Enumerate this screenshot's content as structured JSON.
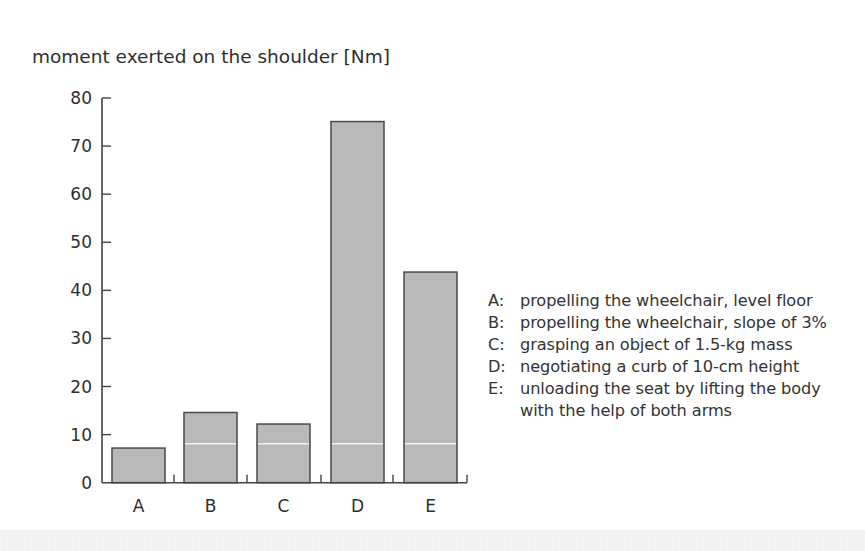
{
  "chart_data": {
    "type": "bar",
    "title": "moment exerted on the shoulder  [Nm]",
    "xlabel": "",
    "ylabel": "moment exerted on the shoulder [Nm]",
    "categories": [
      "A",
      "B",
      "C",
      "D",
      "E"
    ],
    "values": [
      7.2,
      14.6,
      12.2,
      75.1,
      43.8
    ],
    "ylim": [
      0,
      80
    ],
    "yticks": [
      0,
      10,
      20,
      30,
      40,
      50,
      60,
      70,
      80
    ],
    "grid": false,
    "reference_line": {
      "value": 8.1,
      "applies_to": [
        "B",
        "C",
        "D",
        "E"
      ],
      "color": "#f2f2f2"
    },
    "legend_position": "right",
    "legend": [
      {
        "key": "A:",
        "text": [
          "propelling the wheelchair, level floor"
        ]
      },
      {
        "key": "B:",
        "text": [
          "propelling the wheelchair, slope of 3%"
        ]
      },
      {
        "key": "C:",
        "text": [
          "grasping an object of 1.5-kg mass"
        ]
      },
      {
        "key": "D:",
        "text": [
          "negotiating a curb of 10-cm height"
        ]
      },
      {
        "key": "E:",
        "text": [
          "unloading the seat by lifting the body",
          "with the help of both arms"
        ]
      }
    ],
    "colors": {
      "bar_fill": "#b9b9b9",
      "bar_stroke": "#4a4a4a",
      "axis": "#444444",
      "text": "#2e2e2e"
    }
  }
}
